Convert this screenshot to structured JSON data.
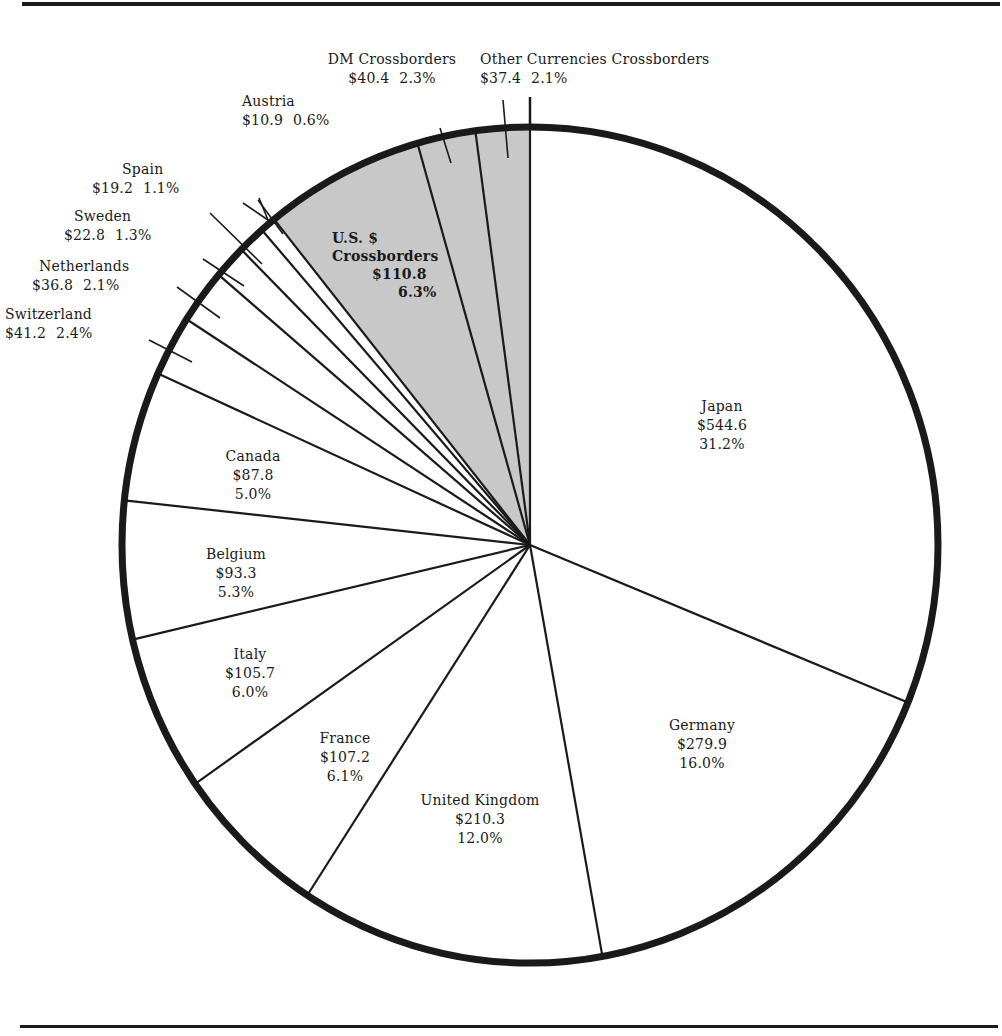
{
  "chart_data": {
    "type": "pie",
    "title": "",
    "units": "$ (billions)",
    "start_angle_deg": 0,
    "direction": "clockwise",
    "slices": [
      {
        "label": "Japan",
        "value": 544.6,
        "percent": "31.2%",
        "value_text": "$544.6",
        "shaded": false
      },
      {
        "label": "Germany",
        "value": 279.9,
        "percent": "16.0%",
        "value_text": "$279.9",
        "shaded": false
      },
      {
        "label": "United Kingdom",
        "value": 210.3,
        "percent": "12.0%",
        "value_text": "$210.3",
        "shaded": false
      },
      {
        "label": "France",
        "value": 107.2,
        "percent": "6.1%",
        "value_text": "$107.2",
        "shaded": false
      },
      {
        "label": "Italy",
        "value": 105.7,
        "percent": "6.0%",
        "value_text": "$105.7",
        "shaded": false
      },
      {
        "label": "Belgium",
        "value": 93.3,
        "percent": "5.3%",
        "value_text": "$93.3",
        "shaded": false
      },
      {
        "label": "Canada",
        "value": 87.8,
        "percent": "5.0%",
        "value_text": "$87.8",
        "shaded": false
      },
      {
        "label": "Switzerland",
        "value": 41.2,
        "percent": "2.4%",
        "value_text": "$41.2",
        "shaded": false
      },
      {
        "label": "Netherlands",
        "value": 36.8,
        "percent": "2.1%",
        "value_text": "$36.8",
        "shaded": false
      },
      {
        "label": "Sweden",
        "value": 22.8,
        "percent": "1.3%",
        "value_text": "$22.8",
        "shaded": false
      },
      {
        "label": "Spain",
        "value": 19.2,
        "percent": "1.1%",
        "value_text": "$19.2",
        "shaded": false
      },
      {
        "label": "Austria",
        "value": 10.9,
        "percent": "0.6%",
        "value_text": "$10.9",
        "shaded": false
      },
      {
        "label": "U.S. $ Crossborders",
        "value": 110.8,
        "percent": "6.3%",
        "value_text": "$110.8",
        "shaded": true
      },
      {
        "label": "DM Crossborders",
        "value": 40.4,
        "percent": "2.3%",
        "value_text": "$40.4",
        "shaded": true
      },
      {
        "label": "Other Currencies Crossborders",
        "value": 37.4,
        "percent": "2.1%",
        "value_text": "$37.4",
        "shaded": true
      }
    ],
    "colors": {
      "fill": "#ffffff",
      "shaded_fill": "#c8c8c8",
      "stroke": "#1a1a1a"
    }
  },
  "labels": {
    "japan": {
      "name": "Japan",
      "value": "$544.6",
      "pct": "31.2%"
    },
    "germany": {
      "name": "Germany",
      "value": "$279.9",
      "pct": "16.0%"
    },
    "uk": {
      "name": "United Kingdom",
      "value": "$210.3",
      "pct": "12.0%"
    },
    "france": {
      "name": "France",
      "value": "$107.2",
      "pct": "6.1%"
    },
    "italy": {
      "name": "Italy",
      "value": "$105.7",
      "pct": "6.0%"
    },
    "belgium": {
      "name": "Belgium",
      "value": "$93.3",
      "pct": "5.3%"
    },
    "canada": {
      "name": "Canada",
      "value": "$87.8",
      "pct": "5.0%"
    },
    "switzerland": {
      "name": "Switzerland",
      "value": "$41.2",
      "pct": "2.4%"
    },
    "netherlands": {
      "name": "Netherlands",
      "value": "$36.8",
      "pct": "2.1%"
    },
    "sweden": {
      "name": "Sweden",
      "value": "$22.8",
      "pct": "1.3%"
    },
    "spain": {
      "name": "Spain",
      "value": "$19.2",
      "pct": "1.1%"
    },
    "austria": {
      "name": "Austria",
      "value": "$10.9",
      "pct": "0.6%"
    },
    "us": {
      "name1": "U.S. $",
      "name2": "Crossborders",
      "value": "$110.8",
      "pct": "6.3%"
    },
    "dm": {
      "name": "DM Crossborders",
      "value": "$40.4",
      "pct": "2.3%"
    },
    "other": {
      "name": "Other Currencies Crossborders",
      "value": "$37.4",
      "pct": "2.1%"
    }
  }
}
